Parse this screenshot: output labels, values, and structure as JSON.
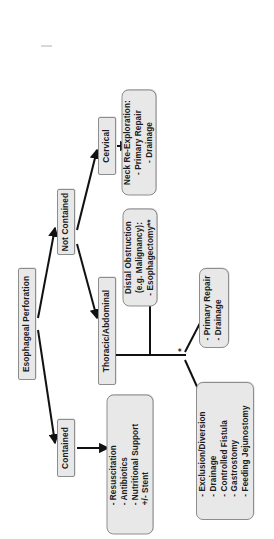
{
  "diagram": {
    "orientation": "rotated-90-ccw",
    "root": {
      "label": "Esophageal Perforation"
    },
    "branches": {
      "contained": {
        "label": "Contained"
      },
      "not_contained": {
        "label": "Not Contained"
      }
    },
    "locations": {
      "cervical": {
        "label": "Cervical"
      },
      "thoracic_abdominal": {
        "label": "Thoracic/Abdominal"
      }
    },
    "treatments": {
      "contained_management": {
        "lines": [
          "- Resuscitation",
          "- Antibiotics",
          "- Nutritional Support",
          "+/- Stent"
        ]
      },
      "cervical_management": {
        "lines": [
          "Neck Re-Exploration:",
          "- Primary Repair",
          "- Drainage"
        ]
      },
      "distal_obstruction": {
        "lines": [
          "Distal Obstruction",
          "(e.g. Malignancy):",
          "- Esophagectomy**"
        ]
      },
      "primary_repair": {
        "lines": [
          "- Primary Repair",
          "- Drainage"
        ]
      },
      "exclusion_diversion": {
        "lines": [
          "- Exclusion/Diversion",
          "- Drainage",
          "- Controlled Fistula",
          "- Gastrostomy",
          "- Feeding Jejunostomy"
        ]
      }
    },
    "annotations": {
      "fork_marker": "*"
    },
    "colors": {
      "node_fill": "#e8e8e8",
      "node_border": "#8d8d8d",
      "edge": "#111111",
      "text": "#1b1b1b",
      "background": "#ffffff"
    }
  }
}
